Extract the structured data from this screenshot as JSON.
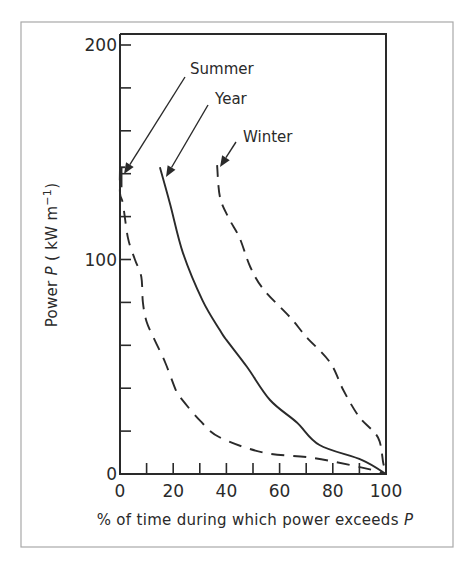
{
  "chart_data": {
    "type": "line",
    "title": "",
    "xlabel": "% of time during which power exceeds P",
    "ylabel": "Power P ( kW m⁻¹)",
    "xlim": [
      0,
      100
    ],
    "ylim": [
      0,
      200
    ],
    "xticks": {
      "labeled": [
        0,
        20,
        40,
        60,
        80,
        100
      ],
      "minor_step": 10
    },
    "yticks": {
      "labeled": [
        0,
        100,
        200
      ],
      "minor_step": 20
    },
    "x_tick_labels": [
      "0",
      "20",
      "40",
      "60",
      "80",
      "100"
    ],
    "y_tick_labels": [
      "0",
      "100",
      "200"
    ],
    "grid": false,
    "legend": "none (curves labelled directly with arrows)",
    "series": [
      {
        "name": "Summer",
        "style": "dashed",
        "x": [
          0,
          0,
          1.1,
          3,
          5.6,
          8,
          8.6,
          10,
          13,
          17,
          21,
          22.5,
          30,
          37.6,
          54,
          72.5,
          91,
          100
        ],
        "y": [
          143,
          131,
          126,
          110,
          100,
          92,
          80,
          71,
          62.5,
          52,
          39,
          36,
          25,
          17,
          10,
          7.5,
          3,
          0
        ]
      },
      {
        "name": "Year",
        "style": "solid",
        "x": [
          15,
          18.8,
          23.7,
          31,
          37.6,
          40,
          47.7,
          56.4,
          66.5,
          75,
          91,
          100
        ],
        "y": [
          143,
          126,
          103,
          81,
          67,
          62.5,
          50,
          34.5,
          24,
          13.5,
          6.5,
          0
        ]
      },
      {
        "name": "Winter",
        "style": "dashed",
        "x": [
          36.5,
          37.6,
          41,
          45,
          49,
          54,
          64,
          70,
          79,
          84,
          90,
          97,
          99,
          100
        ],
        "y": [
          144,
          129,
          119,
          110,
          96.5,
          86,
          73,
          64,
          52,
          39,
          26.5,
          17,
          5,
          0
        ]
      }
    ],
    "annotations": [
      {
        "text": "Summer",
        "points_to_series": "Summer"
      },
      {
        "text": "Year",
        "points_to_series": "Year"
      },
      {
        "text": "Winter",
        "points_to_series": "Winter"
      }
    ]
  },
  "layout": {
    "plot": {
      "x0": 120,
      "x1": 386,
      "y0": 474,
      "y_per_unit": 2.145,
      "top": 34
    },
    "frame": {
      "x": 21,
      "y": 22,
      "w": 432,
      "h": 525
    },
    "labels": {
      "Summer": {
        "x": 190,
        "y": 74,
        "arrow": [
          185,
          77,
          124,
          174
        ]
      },
      "Year": {
        "x": 215,
        "y": 104,
        "arrow": [
          208,
          105,
          166,
          177
        ]
      },
      "Winter": {
        "x": 243,
        "y": 142,
        "arrow": [
          236,
          142,
          220,
          167
        ]
      }
    },
    "colors": {
      "ink": "#2a2a2a",
      "frame": "#a8a8a8",
      "background": "#ffffff"
    }
  }
}
